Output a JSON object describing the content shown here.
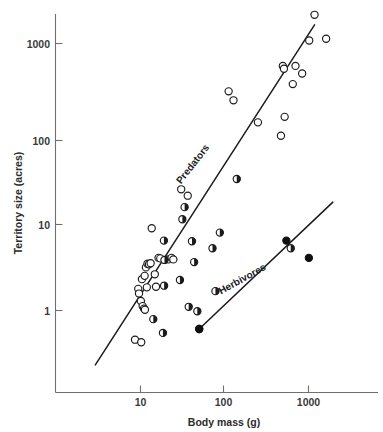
{
  "chart_data": {
    "type": "scatter",
    "title": "",
    "xlabel": "Body mass  (g)",
    "ylabel": "Territory size (acres)",
    "xscale": "log",
    "yscale": "log",
    "xlim": [
      2.2,
      3000
    ],
    "ylim": [
      0.22,
      2600
    ],
    "grid": false,
    "legend_position": "inline-along-lines",
    "xticks": [
      10,
      100,
      1000
    ],
    "xticklabels": [
      "10",
      "100",
      "1000"
    ],
    "yticks": [
      1,
      10,
      100,
      1000
    ],
    "yticklabels": [
      "1",
      "10",
      "100",
      "1000"
    ],
    "annotations": [
      {
        "text": "Predators",
        "x": 45,
        "y": 42,
        "rotation": -52
      },
      {
        "text": "Herbivores",
        "x": 170,
        "y": 2.1,
        "rotation": -29
      }
    ],
    "series": [
      {
        "name": "Predators",
        "marker": "open-circle",
        "marker_fill": "#ffffff",
        "marker_edge": "#1b1b1b",
        "points": [
          [
            8.6,
            0.47
          ],
          [
            10.2,
            0.44
          ],
          [
            9.4,
            1.75
          ],
          [
            9.6,
            1.55
          ],
          [
            10.1,
            1.28
          ],
          [
            10.6,
            1.12
          ],
          [
            11.0,
            1.05
          ],
          [
            11.3,
            1.02
          ],
          [
            10.4,
            2.25
          ],
          [
            11.2,
            2.45
          ],
          [
            11.6,
            3.05
          ],
          [
            12.1,
            3.35
          ],
          [
            12.6,
            3.3
          ],
          [
            13.2,
            3.4
          ],
          [
            11.9,
            1.82
          ],
          [
            13.6,
            8.4
          ],
          [
            14.8,
            2.55
          ],
          [
            15.3,
            1.85
          ],
          [
            16.4,
            3.9
          ],
          [
            17.2,
            3.85
          ],
          [
            21.5,
            3.75
          ],
          [
            23.4,
            3.9
          ],
          [
            24.6,
            3.75
          ],
          [
            30.5,
            23.0
          ],
          [
            36.5,
            19.5
          ],
          [
            112,
            290
          ],
          [
            128,
            230
          ],
          [
            250,
            130
          ],
          [
            470,
            92
          ],
          [
            520,
            150
          ],
          [
            495,
            560
          ],
          [
            510,
            520
          ],
          [
            650,
            350
          ],
          [
            700,
            560
          ],
          [
            840,
            460
          ],
          [
            1020,
            1080
          ],
          [
            1180,
            2100
          ],
          [
            1620,
            1130
          ]
        ]
      },
      {
        "name": "Intermediate",
        "marker": "half-filled-circle",
        "marker_fill": "#1b1b1b",
        "marker_edge": "#1b1b1b",
        "points": [
          [
            14.2,
            0.8
          ],
          [
            18.5,
            0.56
          ],
          [
            19.0,
            6.1
          ],
          [
            19.3,
            3.7
          ],
          [
            19.1,
            1.9
          ],
          [
            29.5,
            2.2
          ],
          [
            31.5,
            10.6
          ],
          [
            33.5,
            14.5
          ],
          [
            37.5,
            1.1
          ],
          [
            41.0,
            6.0
          ],
          [
            43.5,
            3.5
          ],
          [
            47.5,
            0.98
          ],
          [
            50.0,
            0.62
          ],
          [
            72.0,
            5.0
          ],
          [
            78.0,
            1.65
          ],
          [
            88.0,
            7.5
          ],
          [
            140,
            30.0
          ],
          [
            615,
            5.0
          ]
        ]
      },
      {
        "name": "Herbivores",
        "marker": "solid-circle",
        "marker_fill": "#101010",
        "marker_edge": "#101010",
        "points": [
          [
            50.0,
            0.62
          ],
          [
            545,
            6.1
          ],
          [
            1010,
            3.9
          ]
        ]
      }
    ],
    "fit_lines": [
      {
        "name": "Predators",
        "x1": 2.9,
        "y1": 0.245,
        "x2": 1180,
        "y2": 1620
      },
      {
        "name": "Herbivores",
        "x1": 50.0,
        "y1": 0.62,
        "x2": 1950,
        "y2": 16.5
      }
    ]
  },
  "axes": {
    "x_title": "Body mass  (g)",
    "y_title": "Territory size (acres)",
    "x_tick_labels": [
      "10",
      "100",
      "1000"
    ],
    "y_tick_labels": [
      "1000",
      "100",
      "10",
      "1"
    ]
  },
  "labels": {
    "predators": "Predators",
    "herbivores": "Herbivores"
  },
  "colors": {
    "axis": "#6f6f6f",
    "line": "#1b1b1b",
    "marker_edge": "#1b1b1b",
    "marker_solid": "#101010",
    "background": "#ffffff",
    "text": "#2b2b2b"
  }
}
